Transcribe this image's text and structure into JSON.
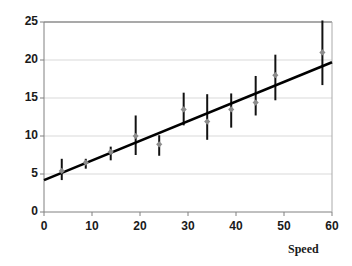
{
  "chart_data": {
    "type": "scatter",
    "title": "",
    "subtitle": "",
    "xlabel": "Speed",
    "ylabel": "",
    "xlim": [
      0,
      60
    ],
    "ylim": [
      0,
      25
    ],
    "xticks": [
      0,
      10,
      20,
      30,
      40,
      50,
      60
    ],
    "yticks": [
      0,
      5,
      10,
      15,
      20,
      25
    ],
    "grid": "horizontal",
    "legend": "none",
    "marker": "diamond",
    "marker_color": "#8c8c8c",
    "errorbar_color": "#111111",
    "line_color": "#000000",
    "axis_color": "#808080",
    "gridline_color": "#d9d9d9",
    "series": [
      {
        "name": "observations",
        "x": [
          3.7,
          8.7,
          13.9,
          19.1,
          24.0,
          29.1,
          34.0,
          39.0,
          44.1,
          48.2,
          58.0
        ],
        "y": [
          5.4,
          6.5,
          7.9,
          10.0,
          8.9,
          13.5,
          11.9,
          13.5,
          14.4,
          18.0,
          21.0
        ],
        "yerr_low": [
          4.2,
          5.7,
          6.8,
          7.5,
          7.4,
          11.4,
          9.5,
          11.1,
          12.7,
          14.7,
          16.7
        ],
        "yerr_high": [
          7.0,
          7.0,
          8.6,
          12.7,
          10.1,
          15.7,
          15.5,
          15.6,
          17.9,
          20.7,
          25.2
        ]
      }
    ],
    "fit_line": {
      "name": "regression-line",
      "x": [
        0,
        60
      ],
      "y": [
        4.2,
        19.7
      ],
      "intercept": 4.2,
      "slope": 0.258
    }
  },
  "axes": {
    "y_tick_labels": [
      "25",
      "20",
      "15",
      "10",
      "5",
      "0"
    ],
    "x_tick_labels": [
      "0",
      "10",
      "20",
      "30",
      "40",
      "50",
      "60"
    ],
    "x_axis_title": "Speed"
  }
}
